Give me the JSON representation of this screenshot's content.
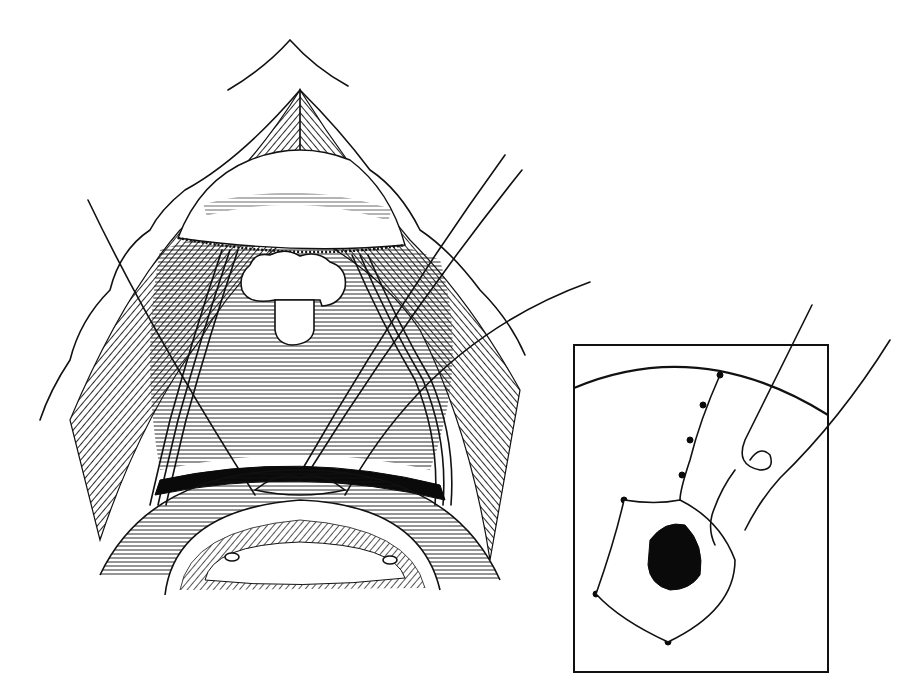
{
  "figure": {
    "type": "surgical line illustration",
    "colors": {
      "ink": "#111111",
      "background": "#ffffff"
    },
    "main_view": {
      "label": "",
      "elements": [
        "incision-apex",
        "retracted-skin-flaps",
        "upper-dome-tissue",
        "central-lobulated-mass",
        "white-rectangular-stump",
        "left-vessel-bundle",
        "right-vessel-bundle",
        "horizontal-hatched-field",
        "stay-sutures",
        "lower-curved-organ"
      ]
    },
    "inset": {
      "label": "",
      "box": {
        "x": 574,
        "y": 345,
        "width": 254,
        "height": 327
      },
      "elements": [
        "curved-boundary",
        "interrupted-suture-line",
        "dark-opening",
        "needle-and-thread"
      ]
    }
  }
}
